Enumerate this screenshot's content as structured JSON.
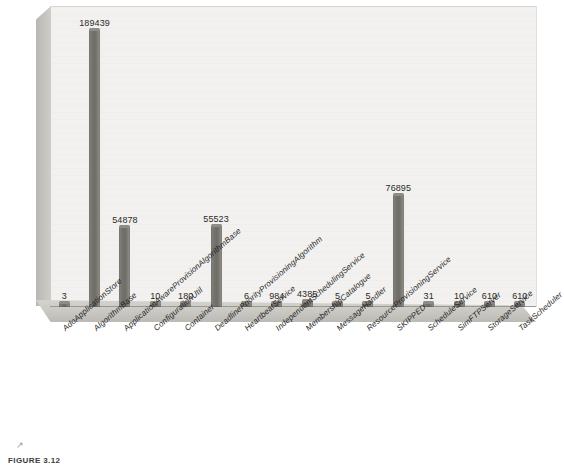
{
  "figure": {
    "caption": "FIGURE 3.12",
    "scan_mark": "↗"
  },
  "chart_data": {
    "type": "bar",
    "title": "",
    "subtitle": "",
    "xlabel": "",
    "ylabel": "",
    "grid": false,
    "legend": "none",
    "axis_ticks": "none",
    "style": "3d-column",
    "data_labels": true,
    "label_rotation_deg": -41,
    "ylim": [
      0,
      200000
    ],
    "categories": [
      "AdoApplicationStore",
      "AlgorithmBase",
      "ApplicationAwareProvisionAlgorithmBase",
      "ConfigurationUtil",
      "Container",
      "DeadlinePriorityProvisioningAlgorithm",
      "HeartbeatService",
      "IndependentSchedulingService",
      "MembershipCatalogue",
      "MessageHandler",
      "ResourceProvisioningService",
      "SKIPPED",
      "ScheduleService",
      "SimFTPServer",
      "StorageService",
      "TaskScheduler"
    ],
    "values": [
      3,
      189439,
      54878,
      10,
      180,
      55523,
      6,
      984,
      4385,
      5,
      5,
      76895,
      31,
      10,
      610,
      610
    ],
    "value_labels": [
      "3",
      "189439",
      "54878",
      "10",
      "180",
      "55523",
      "6",
      "984",
      "4385",
      "5",
      "5",
      "76895",
      "31",
      "10",
      "610",
      "610"
    ]
  },
  "colors": {
    "bar": "#75736d",
    "plot_background": "#f2f1ef",
    "floor": "#c9c7c2",
    "left_wall": "#c2c0bb",
    "text": "#1f1f1f",
    "page": "#ffffff"
  }
}
